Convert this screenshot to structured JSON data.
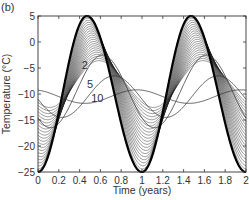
{
  "panel_label": "(b)",
  "chart_data": {
    "type": "line",
    "title": "",
    "xlabel": "Time (years)",
    "ylabel": "Temperature (°C)",
    "xlim": [
      0,
      2
    ],
    "ylim": [
      -25,
      5
    ],
    "xticks": [
      0,
      0.2,
      0.4,
      0.6,
      0.8,
      1,
      1.2,
      1.4,
      1.6,
      1.8,
      2
    ],
    "xtick_labels": [
      "0",
      "0.2",
      "0.4",
      "0.6",
      "0.8",
      "1",
      "1.2",
      "1.4",
      "1.6",
      "1.8",
      "2"
    ],
    "yticks": [
      5,
      0,
      -5,
      -10,
      -15,
      -20,
      -25
    ],
    "ytick_labels": [
      "5",
      "0",
      "−5",
      "−10",
      "−15",
      "−20",
      "−25"
    ],
    "grid": false,
    "legend": null,
    "annotations": [
      {
        "text": "2",
        "x": 0.45,
        "y": -5.2
      },
      {
        "text": "5",
        "x": 0.5,
        "y": -8.8
      },
      {
        "text": "10",
        "x": 0.57,
        "y": -11.5
      }
    ],
    "series": [
      {
        "name": "surface (depth 0)",
        "mean": -10,
        "amplitude": 15,
        "phase_peak": 0.47,
        "lag_years": 0.0,
        "style": "thick"
      },
      {
        "name": "shallow layers (0–2)",
        "note": "dense family of ~20 curves fanning between surface and depth 2, all peaking near t≈0.47 with decreasing amplitude",
        "amplitude_range": [
          15,
          4
        ],
        "style": "thin-family"
      },
      {
        "name": "depth 2",
        "mean": -9.5,
        "amplitude": 7.0,
        "phase_peak": 0.62,
        "style": "thin"
      },
      {
        "name": "depth 5",
        "mean": -10.5,
        "amplitude": 4.0,
        "phase_peak": 0.73,
        "style": "thin"
      },
      {
        "name": "depth 10",
        "mean": -10.5,
        "amplitude": 1.3,
        "phase_peak": 0.95,
        "style": "thin"
      }
    ],
    "sampled_values": {
      "x": [
        0,
        0.1,
        0.2,
        0.3,
        0.4,
        0.47,
        0.6,
        0.7,
        0.8,
        0.9,
        1.0,
        1.2,
        1.4,
        1.47,
        1.6,
        1.8,
        2.0
      ],
      "surface": [
        -24.8,
        -20,
        -12,
        -3,
        3.5,
        5,
        0,
        -9,
        -18,
        -23.5,
        -24.8,
        -12,
        3.5,
        5,
        0,
        -18,
        -24.8
      ],
      "depth_2": [
        -16,
        -14,
        -11,
        -7.5,
        -4.5,
        -3,
        -2.5,
        -3.5,
        -7,
        -12,
        -15,
        -11,
        -4.5,
        -3,
        -2.5,
        -7,
        -15
      ],
      "depth_5": [
        -14,
        -13.5,
        -12.5,
        -11,
        -9,
        -8,
        -6.5,
        -6.5,
        -8,
        -10.5,
        -13.5,
        -12.5,
        -9,
        -8,
        -6.5,
        -8,
        -13.5
      ],
      "depth_10": [
        -9,
        -9.3,
        -9.8,
        -10.5,
        -11,
        -11.3,
        -11.5,
        -11.2,
        -10.8,
        -10,
        -9.3,
        -9.8,
        -11,
        -11.3,
        -11.5,
        -10.8,
        -9.3
      ]
    }
  }
}
